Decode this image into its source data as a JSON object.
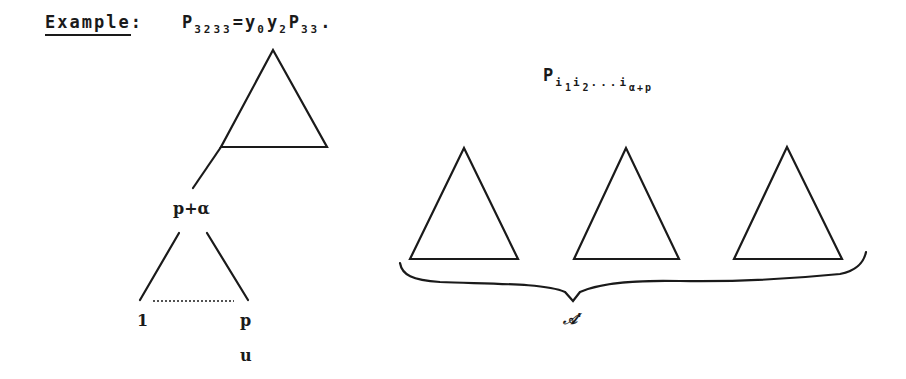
{
  "heading": {
    "label": "Example",
    "colon": ":",
    "formula": {
      "P1": "P",
      "P1_sub": "3233",
      "eq": "=",
      "y0": "y",
      "y0_sub": "0",
      "y2": "y",
      "y2_sub": "2",
      "P2": "P",
      "P2_sub": "33",
      "end": "."
    }
  },
  "left_diagram": {
    "node_label": "p+α",
    "leaf_left": "1",
    "leaf_right": "p",
    "below_label": "u"
  },
  "right_diagram": {
    "formula": {
      "P": "P",
      "i1": "i",
      "i1_sub": "1",
      "i2": "i",
      "i2_sub": "2",
      "dots": "...",
      "ilast": "i",
      "ilast_sub": "α+p"
    },
    "triangle_count": 3,
    "brace_label": "𝒜'"
  },
  "colors": {
    "ink": "#1a1a1a",
    "background": "#ffffff"
  }
}
